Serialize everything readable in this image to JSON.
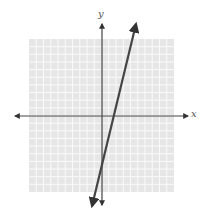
{
  "chart_data": {
    "type": "line",
    "title": "",
    "xlabel": "x",
    "ylabel": "y",
    "grid": true,
    "xlim": [
      -10,
      10
    ],
    "ylim": [
      -10,
      10
    ],
    "grid_cells": 20,
    "series": [
      {
        "name": "line",
        "equation": "y = 4x - 6",
        "slope": 4,
        "y_intercept": -6,
        "x_intercept": 1.5,
        "x": [
          -1.5,
          4.5
        ],
        "y": [
          -12,
          12
        ],
        "arrows_both_ends": true
      }
    ],
    "axes": {
      "x_arrows_both_ends": true,
      "y_arrows_both_ends": true
    }
  },
  "labels": {
    "x_axis": "x",
    "y_axis": "y"
  },
  "colors": {
    "grid_background": "#e6e6e6",
    "grid_lines": "#fafafa",
    "axis": "#444444",
    "line": "#444444"
  }
}
